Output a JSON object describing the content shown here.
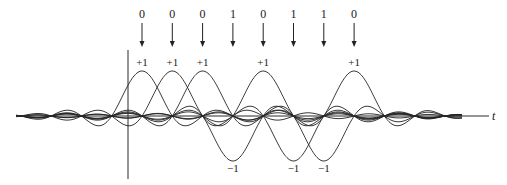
{
  "diagram": {
    "title": "",
    "time_axis_label": "t",
    "bit_to_amplitude": {
      "0": "+1",
      "1": "−1"
    },
    "symbols": [
      {
        "bit": "0",
        "amplitude_label": "+1",
        "amplitude": 1
      },
      {
        "bit": "0",
        "amplitude_label": "+1",
        "amplitude": 1
      },
      {
        "bit": "0",
        "amplitude_label": "+1",
        "amplitude": 1
      },
      {
        "bit": "1",
        "amplitude_label": "−1",
        "amplitude": -1
      },
      {
        "bit": "0",
        "amplitude_label": "+1",
        "amplitude": 1
      },
      {
        "bit": "1",
        "amplitude_label": "−1",
        "amplitude": -1
      },
      {
        "bit": "1",
        "amplitude_label": "−1",
        "amplitude": -1
      },
      {
        "bit": "0",
        "amplitude_label": "+1",
        "amplitude": 1
      }
    ],
    "pulse_shape": "sinc",
    "colors": {
      "line": "#222222",
      "text": "#1a1a1a",
      "background": "#ffffff"
    }
  }
}
